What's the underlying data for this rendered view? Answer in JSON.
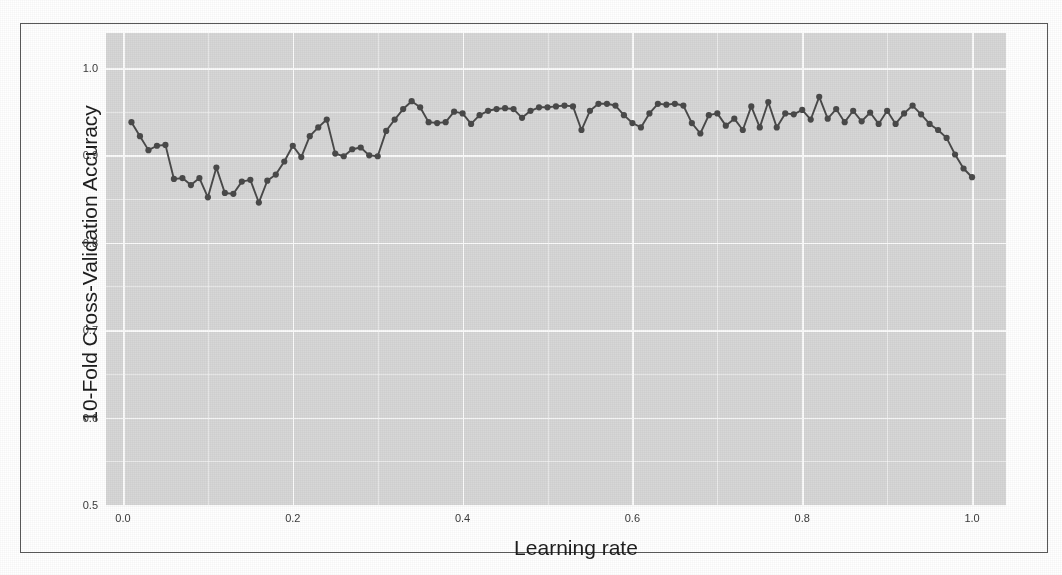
{
  "figure": {
    "panel_bg": "#d7d7d7",
    "grid_color": "#fbfbfb",
    "series_color": "#4a4a4a",
    "frame_color": "#5a5a5a",
    "page_bg": "#ffffff"
  },
  "chart_data": {
    "type": "line",
    "title": "",
    "subtitle": "",
    "xlabel": "Learning rate",
    "ylabel": "10-Fold Cross-Validation Accuracy",
    "xlim": [
      -0.02,
      1.04
    ],
    "ylim": [
      0.5,
      1.04
    ],
    "grid": true,
    "legend": false,
    "legend_position": "none",
    "markers": true,
    "marker_shape": "circle",
    "xticks": [
      0.0,
      0.2,
      0.4,
      0.6,
      0.8,
      1.0
    ],
    "xticklabels": [
      "0.0",
      "0.2",
      "0.4",
      "0.6",
      "0.8",
      "1.0"
    ],
    "yticks": [
      0.5,
      0.6,
      0.7,
      0.8,
      0.9,
      1.0
    ],
    "yticklabels": [
      "0.5",
      "0.6",
      "0.7",
      "0.8",
      "0.9",
      "1.0"
    ],
    "minor_yticks": [
      0.55,
      0.65,
      0.75,
      0.85,
      0.95
    ],
    "minor_xticks": [
      0.1,
      0.3,
      0.5,
      0.7,
      0.9
    ],
    "series": [
      {
        "name": "10-Fold CV Accuracy",
        "x": [
          0.01,
          0.02,
          0.03,
          0.04,
          0.05,
          0.06,
          0.07,
          0.08,
          0.09,
          0.1,
          0.11,
          0.12,
          0.13,
          0.14,
          0.15,
          0.16,
          0.17,
          0.18,
          0.19,
          0.2,
          0.21,
          0.22,
          0.23,
          0.24,
          0.25,
          0.26,
          0.27,
          0.28,
          0.29,
          0.3,
          0.31,
          0.32,
          0.33,
          0.34,
          0.35,
          0.36,
          0.37,
          0.38,
          0.39,
          0.4,
          0.41,
          0.42,
          0.43,
          0.44,
          0.45,
          0.46,
          0.47,
          0.48,
          0.49,
          0.5,
          0.51,
          0.52,
          0.53,
          0.54,
          0.55,
          0.56,
          0.57,
          0.58,
          0.59,
          0.6,
          0.61,
          0.62,
          0.63,
          0.64,
          0.65,
          0.66,
          0.67,
          0.68,
          0.69,
          0.7,
          0.71,
          0.72,
          0.73,
          0.74,
          0.75,
          0.76,
          0.77,
          0.78,
          0.79,
          0.8,
          0.81,
          0.82,
          0.83,
          0.84,
          0.85,
          0.86,
          0.87,
          0.88,
          0.89,
          0.9,
          0.91,
          0.92,
          0.93,
          0.94,
          0.95,
          0.96,
          0.97,
          0.98,
          0.99,
          1.0
        ],
        "y": [
          0.938,
          0.922,
          0.906,
          0.911,
          0.912,
          0.873,
          0.874,
          0.866,
          0.874,
          0.852,
          0.886,
          0.857,
          0.856,
          0.87,
          0.872,
          0.846,
          0.871,
          0.878,
          0.893,
          0.911,
          0.898,
          0.922,
          0.932,
          0.941,
          0.902,
          0.899,
          0.907,
          0.909,
          0.9,
          0.899,
          0.928,
          0.941,
          0.953,
          0.962,
          0.955,
          0.938,
          0.937,
          0.938,
          0.95,
          0.948,
          0.936,
          0.946,
          0.951,
          0.953,
          0.954,
          0.953,
          0.943,
          0.951,
          0.955,
          0.955,
          0.956,
          0.957,
          0.956,
          0.929,
          0.951,
          0.959,
          0.959,
          0.957,
          0.946,
          0.937,
          0.932,
          0.948,
          0.959,
          0.958,
          0.959,
          0.957,
          0.937,
          0.925,
          0.946,
          0.948,
          0.934,
          0.942,
          0.929,
          0.956,
          0.932,
          0.961,
          0.932,
          0.948,
          0.947,
          0.952,
          0.941,
          0.967,
          0.942,
          0.953,
          0.938,
          0.951,
          0.939,
          0.949,
          0.936,
          0.951,
          0.936,
          0.948,
          0.957,
          0.947,
          0.936,
          0.929,
          0.92,
          0.901,
          0.885,
          0.875
        ]
      }
    ]
  }
}
